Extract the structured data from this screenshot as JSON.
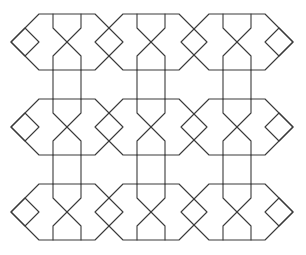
{
  "diagram": {
    "title": "",
    "type": "geometric-tiling-pattern",
    "stroke_color": "#3a3a3a",
    "background_color": "#ffffff",
    "stroke_width": 1.1,
    "grid": {
      "rows": 3,
      "cols": 3,
      "row_centers_y": [
        42,
        127,
        212
      ],
      "col_centers_x": [
        67,
        151,
        237
      ]
    },
    "tile": {
      "shape": "elongated-hexagon-with-x-and-end-diamonds",
      "half_width_point": 56,
      "half_width_flat": 28,
      "half_height": 28,
      "vertical_offset_x": 14,
      "x_arm_inset_y": 14,
      "diamond_half_size": 14
    }
  }
}
